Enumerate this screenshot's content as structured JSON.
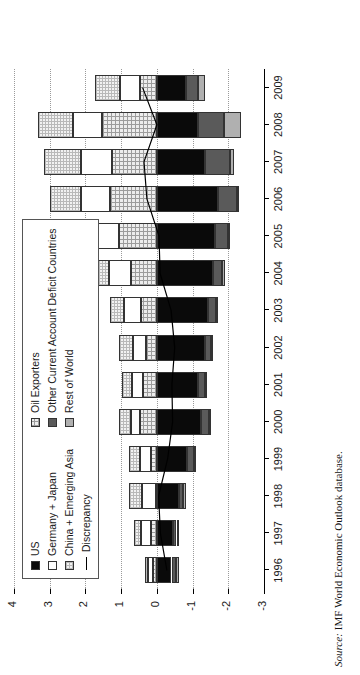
{
  "figure": {
    "source_label": "Source:",
    "source_text": "IMF World Economic Outlook database."
  },
  "axes": {
    "y_title": "Percentage of Global GDP",
    "y_ticks": [
      "4",
      "3",
      "2",
      "1",
      "0",
      "-1",
      "-2",
      "-3"
    ],
    "y_tick_values": [
      4,
      3,
      2,
      1,
      0,
      -1,
      -2,
      -3
    ],
    "ylim": [
      -3,
      4
    ],
    "x_ticks": [
      "1996",
      "1997",
      "1998",
      "1999",
      "2000",
      "2001",
      "2002",
      "2003",
      "2004",
      "2005",
      "2006",
      "2007",
      "2008",
      "2009"
    ]
  },
  "legend": {
    "column1": [
      {
        "label": "US",
        "key": "us",
        "swatch": "solid-black-swatch"
      },
      {
        "label": "Germany + Japan",
        "key": "gj",
        "swatch": "white-swatch"
      },
      {
        "label": "China + Emerging Asia",
        "key": "cea",
        "swatch": "light-grid-swatch"
      },
      {
        "label": "Discrepancy",
        "key": "discrepancy",
        "swatch": "line-swatch"
      }
    ],
    "column2": [
      {
        "label": "Oil Exporters",
        "key": "oil",
        "swatch": "fine-grid-swatch"
      },
      {
        "label": "Other Current Account Deficit Countries",
        "key": "ocad",
        "swatch": "dark-grey-swatch"
      },
      {
        "label": "Rest of World",
        "key": "row",
        "swatch": "grey-swatch"
      }
    ]
  },
  "colors": {
    "us": "#0a0a0a",
    "gj": "#ffffff",
    "cea": "#f2f2f2",
    "oil": "#ededed",
    "ocad": "#5a5a5a",
    "row": "#b0b0b0",
    "discrepancy": "#000000",
    "grid": "#9a9a9a",
    "axis": "#000000"
  },
  "chart_data": {
    "type": "bar",
    "stacked": true,
    "orientation": "vertical",
    "title": "",
    "xlabel": "",
    "ylabel": "Percentage of Global GDP",
    "ylim": [
      -3,
      4
    ],
    "grid": true,
    "legend_position": "upper-left",
    "categories": [
      "1996",
      "1997",
      "1998",
      "1999",
      "2000",
      "2001",
      "2002",
      "2003",
      "2004",
      "2005",
      "2006",
      "2007",
      "2008",
      "2009"
    ],
    "series": [
      {
        "name": "Oil Exporters",
        "key": "oil",
        "values": [
          0.1,
          0.17,
          0.02,
          0.17,
          0.47,
          0.4,
          0.3,
          0.45,
          0.72,
          1.07,
          1.3,
          1.25,
          1.54,
          0.47
        ]
      },
      {
        "name": "Germany + Japan",
        "key": "gj",
        "values": [
          0.16,
          0.27,
          0.39,
          0.31,
          0.26,
          0.3,
          0.38,
          0.47,
          0.63,
          0.64,
          0.82,
          0.88,
          0.82,
          0.57
        ]
      },
      {
        "name": "China + Emerging Asia",
        "key": "cea",
        "values": [
          0.07,
          0.21,
          0.36,
          0.31,
          0.33,
          0.27,
          0.37,
          0.4,
          0.46,
          0.6,
          0.87,
          1.03,
          0.98,
          0.7
        ]
      },
      {
        "name": "US",
        "key": "us",
        "values": [
          -0.41,
          -0.45,
          -0.63,
          -0.84,
          -1.23,
          -1.16,
          -1.34,
          -1.44,
          -1.57,
          -1.62,
          -1.7,
          -1.36,
          -1.14,
          -0.81
        ]
      },
      {
        "name": "Other Current Account Deficit Countries",
        "key": "ocad",
        "values": [
          -0.13,
          -0.1,
          -0.11,
          -0.2,
          -0.22,
          -0.18,
          -0.17,
          -0.21,
          -0.25,
          -0.38,
          -0.54,
          -0.69,
          -0.75,
          -0.33
        ]
      },
      {
        "name": "Rest of World",
        "key": "row",
        "values": [
          -0.07,
          -0.04,
          -0.08,
          -0.06,
          -0.05,
          -0.05,
          -0.05,
          -0.06,
          -0.08,
          -0.05,
          -0.04,
          -0.1,
          -0.47,
          -0.22
        ]
      }
    ],
    "line_series": [
      {
        "name": "Discrepancy",
        "key": "discrepancy",
        "values": [
          -0.28,
          -0.1,
          -0.05,
          -0.3,
          -0.44,
          -0.42,
          -0.5,
          -0.4,
          -0.09,
          -0.06,
          0.28,
          0.36,
          0.0,
          0.4
        ]
      }
    ]
  }
}
